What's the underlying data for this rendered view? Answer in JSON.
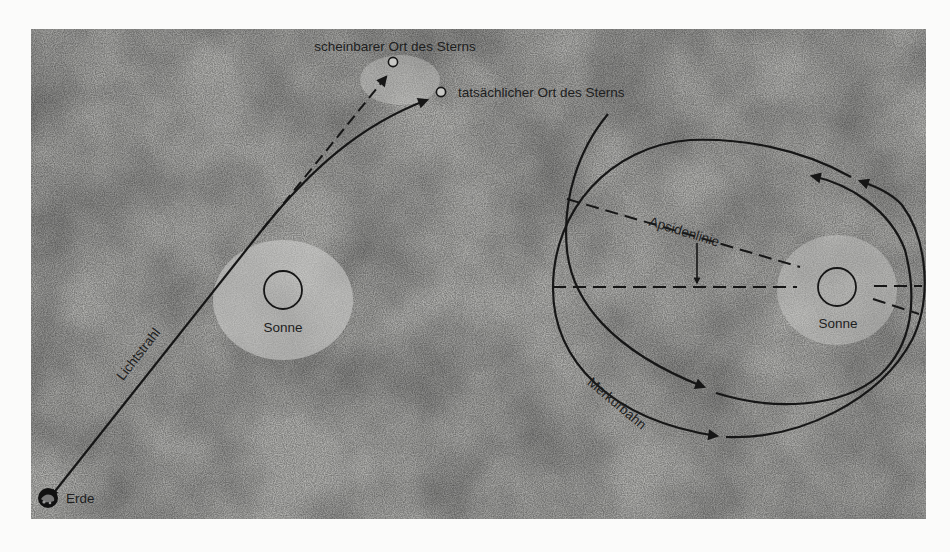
{
  "figure": {
    "background_color": "#fbfbfa",
    "panel_color": "#aeaeab",
    "ink_color": "#161616"
  },
  "left_diagram": {
    "apparent_star_label": "scheinbarer Ort des Sterns",
    "actual_star_label": "tatsächlicher Ort des Sterns",
    "sun_label": "Sonne",
    "light_ray_label": "Lichtstrahl",
    "earth_label": "Erde"
  },
  "right_diagram": {
    "apsidal_line_label": "Apsidenlinie",
    "sun_label": "Sonne",
    "orbit_label": "Merkurbahn"
  }
}
